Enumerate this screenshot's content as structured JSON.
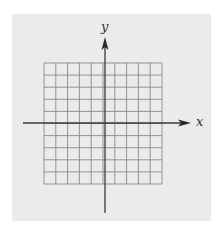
{
  "figure": {
    "type": "coordinate-plane",
    "background_color": "#ebebeb",
    "grid_color": "#8a8a8a",
    "axis_color": "#3a3a3a",
    "grid": {
      "columns": 10,
      "rows": 10,
      "left": 44,
      "top": 63,
      "right": 162,
      "bottom": 184
    },
    "origin": {
      "x": 105,
      "y": 123
    },
    "x_axis": {
      "label": "x",
      "start": 23,
      "end": 191
    },
    "y_axis": {
      "label": "y",
      "start": 213,
      "end": 37
    }
  }
}
